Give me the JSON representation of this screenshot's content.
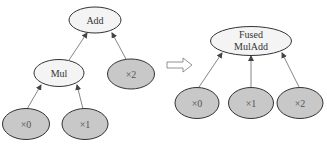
{
  "diagram": {
    "left_graph": {
      "nodes": [
        {
          "id": "add",
          "label": "Add",
          "type": "op"
        },
        {
          "id": "mul",
          "label": "Mul",
          "type": "op"
        },
        {
          "id": "x2",
          "label": "×2",
          "type": "input"
        },
        {
          "id": "x0",
          "label": "×0",
          "type": "input"
        },
        {
          "id": "x1",
          "label": "×1",
          "type": "input"
        }
      ],
      "edges": [
        {
          "from": "mul",
          "to": "add"
        },
        {
          "from": "x2",
          "to": "add"
        },
        {
          "from": "x0",
          "to": "mul"
        },
        {
          "from": "x1",
          "to": "mul"
        }
      ]
    },
    "transform_arrow": "hollow-right-arrow",
    "right_graph": {
      "nodes": [
        {
          "id": "fused",
          "label_line1": "Fused",
          "label_line2": "MulAdd",
          "type": "op"
        },
        {
          "id": "x0",
          "label": "×0",
          "type": "input"
        },
        {
          "id": "x1",
          "label": "×1",
          "type": "input"
        },
        {
          "id": "x2",
          "label": "×2",
          "type": "input"
        }
      ],
      "edges": [
        {
          "from": "x0",
          "to": "fused"
        },
        {
          "from": "x1",
          "to": "fused"
        },
        {
          "from": "x2",
          "to": "fused"
        }
      ]
    },
    "colors": {
      "op_fill": "#f4f4f4",
      "input_fill": "#c8c8c8",
      "stroke": "#333333",
      "edge": "#666666"
    }
  }
}
